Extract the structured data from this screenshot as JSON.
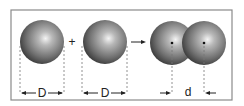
{
  "diagram": {
    "operator_plus": "+",
    "labels": {
      "sphere1_diameter": "D",
      "sphere2_diameter": "D",
      "bond_distance": "d"
    },
    "colors": {
      "frame": "#8a8a8a",
      "sphere_dark": "#3a3a3a",
      "sphere_mid": "#7a7a7a",
      "sphere_highlight": "#f4f4f4",
      "dashed": "#777777"
    }
  }
}
